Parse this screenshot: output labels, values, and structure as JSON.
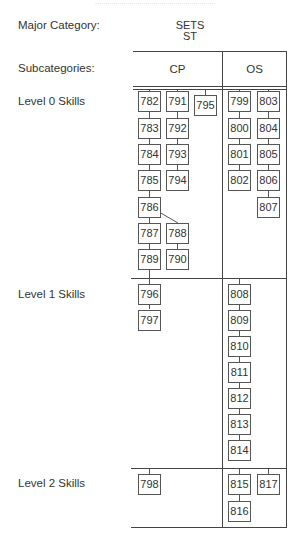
{
  "labels": {
    "major_category": "Major Category:",
    "subcategories": "Subcategories:",
    "level0": "Level 0 Skills",
    "level1": "Level 1 Skills",
    "level2": "Level 2 Skills"
  },
  "major": {
    "name": "SETS",
    "code": "ST"
  },
  "subcategories": [
    "CP",
    "OS"
  ],
  "skills": {
    "level0": {
      "CP": [
        [
          "782",
          "783",
          "784",
          "785",
          "786",
          "787",
          "789"
        ],
        [
          "791",
          "792",
          "793",
          "794",
          "788",
          "790"
        ],
        [
          "795"
        ]
      ],
      "OS": [
        [
          "799",
          "800",
          "801",
          "802"
        ],
        [
          "803",
          "804",
          "805",
          "806",
          "807"
        ]
      ]
    },
    "level1": {
      "CP": [
        [
          "796",
          "797"
        ]
      ],
      "OS": [
        [
          "808",
          "809",
          "810",
          "811",
          "812",
          "813",
          "814"
        ]
      ]
    },
    "level2": {
      "CP": [
        [
          "798"
        ]
      ],
      "OS": [
        [
          "815",
          "816"
        ],
        [
          "817"
        ]
      ]
    }
  },
  "boxes": {
    "b782": "782",
    "b783": "783",
    "b784": "784",
    "b785": "785",
    "b786": "786",
    "b787": "787",
    "b789": "789",
    "b791": "791",
    "b792": "792",
    "b793": "793",
    "b794": "794",
    "b788": "788",
    "b790": "790",
    "b795": "795",
    "b799": "799",
    "b800": "800",
    "b801": "801",
    "b802": "802",
    "b803": "803",
    "b804": "804",
    "b805": "805",
    "b806": "806",
    "b807": "807",
    "b796": "796",
    "b797": "797",
    "b808": "808",
    "b809": "809",
    "b810": "810",
    "b811": "811",
    "b812": "812",
    "b813": "813",
    "b814": "814",
    "b798": "798",
    "b815": "815",
    "b816": "816",
    "b817": "817"
  }
}
